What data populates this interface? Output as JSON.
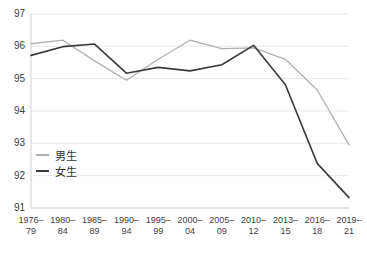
{
  "chart_data": {
    "type": "line",
    "title": "",
    "xlabel": "",
    "ylabel": "",
    "grid": true,
    "legend_position": "inside-left",
    "categories": [
      "1976–\n79",
      "1980–\n84",
      "1985–\n89",
      "1990–\n94",
      "1995–\n99",
      "2000–\n04",
      "2005–\n09",
      "2010–\n12",
      "2013–\n15",
      "2016–\n18",
      "2019–\n21"
    ],
    "ylim": [
      91,
      97
    ],
    "yticks": [
      "91",
      "92",
      "93",
      "94",
      "95",
      "96",
      "97"
    ],
    "series": [
      {
        "name": "男生",
        "color": "#b0b0b0",
        "values": [
          96.08,
          96.19,
          95.55,
          94.95,
          95.6,
          96.19,
          95.93,
          95.95,
          95.6,
          94.65,
          92.95
        ]
      },
      {
        "name": "女生",
        "color": "#3a3a3a",
        "values": [
          95.72,
          95.99,
          96.07,
          95.17,
          95.35,
          95.24,
          95.43,
          96.03,
          94.81,
          92.38,
          91.32
        ]
      }
    ]
  },
  "legend": {
    "items": [
      {
        "label": "男生",
        "color": "#b0b0b0"
      },
      {
        "label": "女生",
        "color": "#3a3a3a"
      }
    ]
  }
}
